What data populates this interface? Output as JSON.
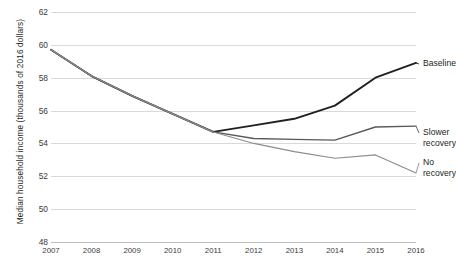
{
  "chart_data": {
    "type": "line",
    "title": "",
    "xlabel": "",
    "ylabel": "Median household income (thousands of 2016 dollars)",
    "x": [
      2007,
      2008,
      2009,
      2010,
      2011,
      2012,
      2013,
      2014,
      2015,
      2016
    ],
    "categories": [
      "2007",
      "2008",
      "2009",
      "2010",
      "2011",
      "2012",
      "2013",
      "2014",
      "2015",
      "2016"
    ],
    "xlim": [
      2007,
      2016
    ],
    "ylim": [
      48,
      62
    ],
    "yticks": [
      48,
      50,
      52,
      54,
      56,
      58,
      60,
      62
    ],
    "ytick_labels": [
      "48",
      "50",
      "52",
      "54",
      "56",
      "58",
      "60",
      "62"
    ],
    "grid": true,
    "legend_position": "right-inline-labels",
    "series": [
      {
        "name": "Baseline",
        "color": "#231f20",
        "width": 1.9,
        "values": [
          59.7,
          58.1,
          56.9,
          55.8,
          54.7,
          55.1,
          55.5,
          56.3,
          58.0,
          58.9
        ]
      },
      {
        "name": "Slower recovery",
        "color": "#58595b",
        "width": 1.35,
        "values": [
          59.7,
          58.1,
          56.9,
          55.8,
          54.7,
          54.3,
          54.25,
          54.2,
          55.0,
          55.05
        ]
      },
      {
        "name": "No recovery",
        "color": "#8c8c8c",
        "width": 1.15,
        "values": [
          59.7,
          58.1,
          56.9,
          55.8,
          54.7,
          54.0,
          53.5,
          53.1,
          53.3,
          52.2
        ]
      }
    ],
    "annotations": [
      {
        "text": "Baseline",
        "series": "Baseline"
      },
      {
        "text": "Slower\nrecovery",
        "series": "Slower recovery"
      },
      {
        "text": "No\nrecovery",
        "series": "No recovery"
      }
    ]
  },
  "caption": {
    "text": ""
  }
}
